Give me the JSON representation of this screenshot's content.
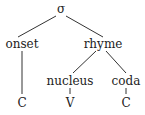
{
  "tree": {
    "root": {
      "label": "σ"
    },
    "onset": {
      "label": "onset"
    },
    "rhyme": {
      "label": "rhyme"
    },
    "nucleus": {
      "label": "nucleus"
    },
    "coda": {
      "label": "coda"
    },
    "onset_leaf": {
      "label": "C"
    },
    "nucleus_leaf": {
      "label": "V"
    },
    "coda_leaf": {
      "label": "C"
    }
  },
  "colors": {
    "line": "#333333",
    "text": "#222222"
  }
}
